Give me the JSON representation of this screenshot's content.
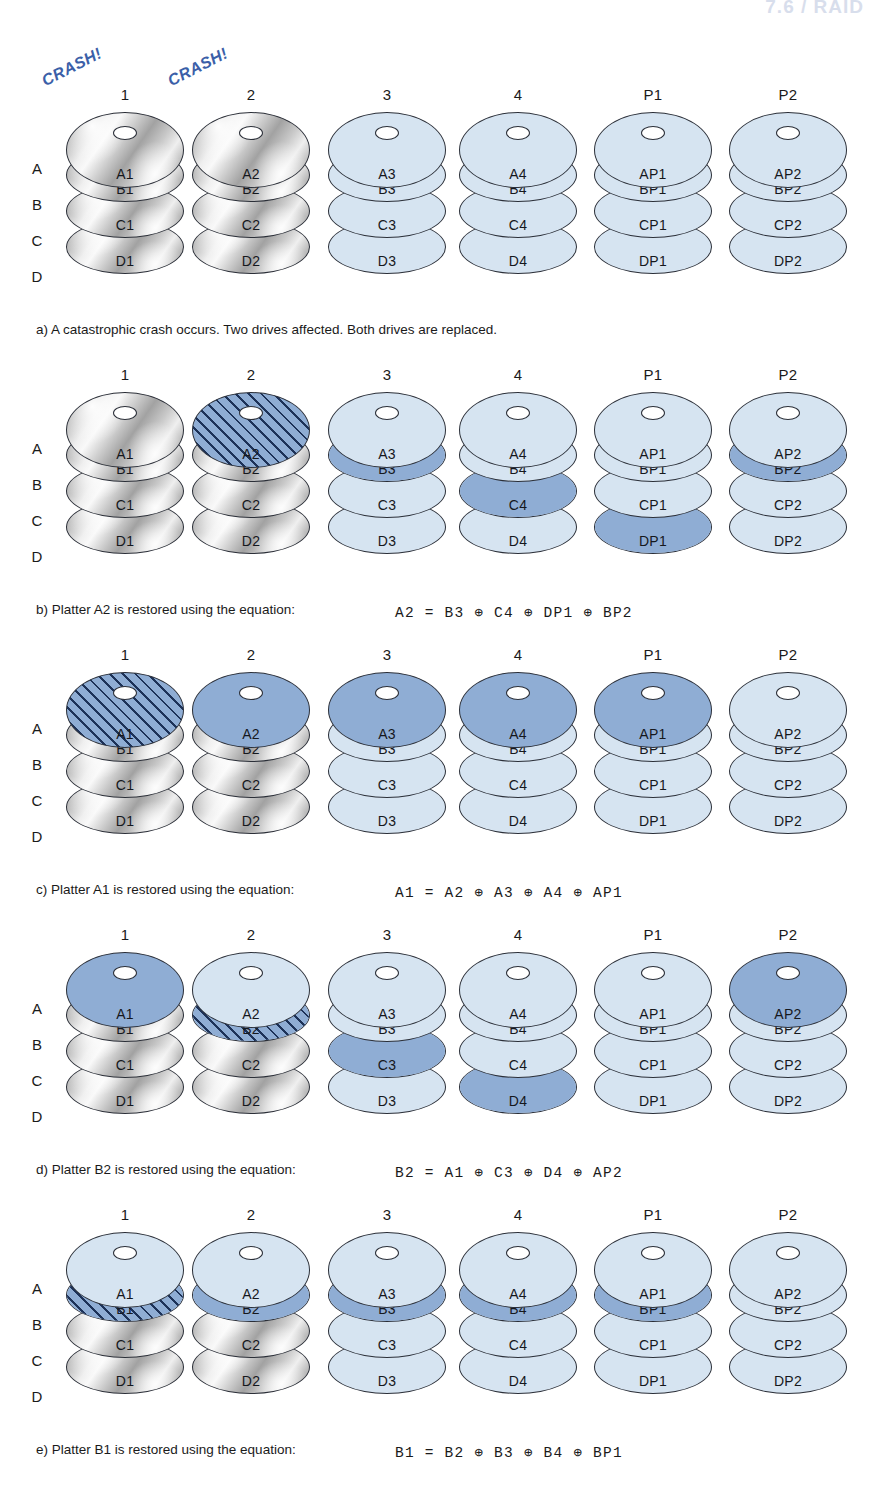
{
  "figure": {
    "page_header": "7.6 / RAID",
    "row_labels": [
      "A",
      "B",
      "C",
      "D"
    ],
    "columns": [
      "1",
      "2",
      "3",
      "4",
      "P1",
      "P2"
    ],
    "crash_label": "CRASH!",
    "xor_symbol": "⊕"
  },
  "panels": [
    {
      "id": "a",
      "caption": "a) A catastrophic crash occurs. Two drives affected. Both drives are replaced.",
      "equation": "",
      "crash_columns": [
        "1",
        "2"
      ],
      "stacks": [
        {
          "column": "1",
          "platters": [
            {
              "label": "A1",
              "state": "gray"
            },
            {
              "label": "B1",
              "state": "gray"
            },
            {
              "label": "C1",
              "state": "gray"
            },
            {
              "label": "D1",
              "state": "gray"
            }
          ]
        },
        {
          "column": "2",
          "platters": [
            {
              "label": "A2",
              "state": "gray"
            },
            {
              "label": "B2",
              "state": "gray"
            },
            {
              "label": "C2",
              "state": "gray"
            },
            {
              "label": "D2",
              "state": "gray"
            }
          ]
        },
        {
          "column": "3",
          "platters": [
            {
              "label": "A3",
              "state": "light"
            },
            {
              "label": "B3",
              "state": "light"
            },
            {
              "label": "C3",
              "state": "light"
            },
            {
              "label": "D3",
              "state": "light"
            }
          ]
        },
        {
          "column": "4",
          "platters": [
            {
              "label": "A4",
              "state": "light"
            },
            {
              "label": "B4",
              "state": "light"
            },
            {
              "label": "C4",
              "state": "light"
            },
            {
              "label": "D4",
              "state": "light"
            }
          ]
        },
        {
          "column": "P1",
          "platters": [
            {
              "label": "AP1",
              "state": "light"
            },
            {
              "label": "BP1",
              "state": "light"
            },
            {
              "label": "CP1",
              "state": "light"
            },
            {
              "label": "DP1",
              "state": "light"
            }
          ]
        },
        {
          "column": "P2",
          "platters": [
            {
              "label": "AP2",
              "state": "light"
            },
            {
              "label": "BP2",
              "state": "light"
            },
            {
              "label": "CP2",
              "state": "light"
            },
            {
              "label": "DP2",
              "state": "light"
            }
          ]
        }
      ]
    },
    {
      "id": "b",
      "caption": "b) Platter A2 is restored using the equation:",
      "equation": "A2  =  B3  ⊕  C4  ⊕  DP1  ⊕  BP2",
      "crash_columns": [],
      "stacks": [
        {
          "column": "1",
          "platters": [
            {
              "label": "A1",
              "state": "gray"
            },
            {
              "label": "B1",
              "state": "gray"
            },
            {
              "label": "C1",
              "state": "gray"
            },
            {
              "label": "D1",
              "state": "gray"
            }
          ]
        },
        {
          "column": "2",
          "platters": [
            {
              "label": "A2",
              "state": "hatch"
            },
            {
              "label": "B2",
              "state": "gray"
            },
            {
              "label": "C2",
              "state": "gray"
            },
            {
              "label": "D2",
              "state": "gray"
            }
          ]
        },
        {
          "column": "3",
          "platters": [
            {
              "label": "A3",
              "state": "light"
            },
            {
              "label": "B3",
              "state": "highlight"
            },
            {
              "label": "C3",
              "state": "light"
            },
            {
              "label": "D3",
              "state": "light"
            }
          ]
        },
        {
          "column": "4",
          "platters": [
            {
              "label": "A4",
              "state": "light"
            },
            {
              "label": "B4",
              "state": "light"
            },
            {
              "label": "C4",
              "state": "highlight"
            },
            {
              "label": "D4",
              "state": "light"
            }
          ]
        },
        {
          "column": "P1",
          "platters": [
            {
              "label": "AP1",
              "state": "light"
            },
            {
              "label": "BP1",
              "state": "light"
            },
            {
              "label": "CP1",
              "state": "light"
            },
            {
              "label": "DP1",
              "state": "highlight"
            }
          ]
        },
        {
          "column": "P2",
          "platters": [
            {
              "label": "AP2",
              "state": "light"
            },
            {
              "label": "BP2",
              "state": "highlight"
            },
            {
              "label": "CP2",
              "state": "light"
            },
            {
              "label": "DP2",
              "state": "light"
            }
          ]
        }
      ]
    },
    {
      "id": "c",
      "caption": "c) Platter A1 is restored using the equation:",
      "equation": "A1  =  A2  ⊕  A3  ⊕  A4  ⊕  AP1",
      "crash_columns": [],
      "stacks": [
        {
          "column": "1",
          "platters": [
            {
              "label": "A1",
              "state": "hatch"
            },
            {
              "label": "B1",
              "state": "gray"
            },
            {
              "label": "C1",
              "state": "gray"
            },
            {
              "label": "D1",
              "state": "gray"
            }
          ]
        },
        {
          "column": "2",
          "platters": [
            {
              "label": "A2",
              "state": "highlight"
            },
            {
              "label": "B2",
              "state": "gray"
            },
            {
              "label": "C2",
              "state": "gray"
            },
            {
              "label": "D2",
              "state": "gray"
            }
          ]
        },
        {
          "column": "3",
          "platters": [
            {
              "label": "A3",
              "state": "highlight"
            },
            {
              "label": "B3",
              "state": "light"
            },
            {
              "label": "C3",
              "state": "light"
            },
            {
              "label": "D3",
              "state": "light"
            }
          ]
        },
        {
          "column": "4",
          "platters": [
            {
              "label": "A4",
              "state": "highlight"
            },
            {
              "label": "B4",
              "state": "light"
            },
            {
              "label": "C4",
              "state": "light"
            },
            {
              "label": "D4",
              "state": "light"
            }
          ]
        },
        {
          "column": "P1",
          "platters": [
            {
              "label": "AP1",
              "state": "highlight"
            },
            {
              "label": "BP1",
              "state": "light"
            },
            {
              "label": "CP1",
              "state": "light"
            },
            {
              "label": "DP1",
              "state": "light"
            }
          ]
        },
        {
          "column": "P2",
          "platters": [
            {
              "label": "AP2",
              "state": "light"
            },
            {
              "label": "BP2",
              "state": "light"
            },
            {
              "label": "CP2",
              "state": "light"
            },
            {
              "label": "DP2",
              "state": "light"
            }
          ]
        }
      ]
    },
    {
      "id": "d",
      "caption": "d) Platter B2 is restored using the equation:",
      "equation": "B2  =  A1  ⊕  C3  ⊕  D4  ⊕  AP2",
      "crash_columns": [],
      "stacks": [
        {
          "column": "1",
          "platters": [
            {
              "label": "A1",
              "state": "highlight-top"
            },
            {
              "label": "B1",
              "state": "gray"
            },
            {
              "label": "C1",
              "state": "gray"
            },
            {
              "label": "D1",
              "state": "gray"
            }
          ]
        },
        {
          "column": "2",
          "platters": [
            {
              "label": "A2",
              "state": "light"
            },
            {
              "label": "B2",
              "state": "hatch"
            },
            {
              "label": "C2",
              "state": "gray"
            },
            {
              "label": "D2",
              "state": "gray"
            }
          ]
        },
        {
          "column": "3",
          "platters": [
            {
              "label": "A3",
              "state": "light"
            },
            {
              "label": "B3",
              "state": "light"
            },
            {
              "label": "C3",
              "state": "highlight"
            },
            {
              "label": "D3",
              "state": "light"
            }
          ]
        },
        {
          "column": "4",
          "platters": [
            {
              "label": "A4",
              "state": "light"
            },
            {
              "label": "B4",
              "state": "light"
            },
            {
              "label": "C4",
              "state": "light"
            },
            {
              "label": "D4",
              "state": "highlight"
            }
          ]
        },
        {
          "column": "P1",
          "platters": [
            {
              "label": "AP1",
              "state": "light"
            },
            {
              "label": "BP1",
              "state": "light"
            },
            {
              "label": "CP1",
              "state": "light"
            },
            {
              "label": "DP1",
              "state": "light"
            }
          ]
        },
        {
          "column": "P2",
          "platters": [
            {
              "label": "AP2",
              "state": "highlight-top"
            },
            {
              "label": "BP2",
              "state": "light"
            },
            {
              "label": "CP2",
              "state": "light"
            },
            {
              "label": "DP2",
              "state": "light"
            }
          ]
        }
      ]
    },
    {
      "id": "e",
      "caption": "e) Platter B1 is restored using the equation:",
      "equation": "B1  =  B2  ⊕  B3  ⊕  B4  ⊕  BP1",
      "crash_columns": [],
      "stacks": [
        {
          "column": "1",
          "platters": [
            {
              "label": "A1",
              "state": "light"
            },
            {
              "label": "B1",
              "state": "hatch"
            },
            {
              "label": "C1",
              "state": "gray"
            },
            {
              "label": "D1",
              "state": "gray"
            }
          ]
        },
        {
          "column": "2",
          "platters": [
            {
              "label": "A2",
              "state": "light"
            },
            {
              "label": "B2",
              "state": "highlight"
            },
            {
              "label": "C2",
              "state": "gray"
            },
            {
              "label": "D2",
              "state": "gray"
            }
          ]
        },
        {
          "column": "3",
          "platters": [
            {
              "label": "A3",
              "state": "light"
            },
            {
              "label": "B3",
              "state": "highlight"
            },
            {
              "label": "C3",
              "state": "light"
            },
            {
              "label": "D3",
              "state": "light"
            }
          ]
        },
        {
          "column": "4",
          "platters": [
            {
              "label": "A4",
              "state": "light"
            },
            {
              "label": "B4",
              "state": "highlight"
            },
            {
              "label": "C4",
              "state": "light"
            },
            {
              "label": "D4",
              "state": "light"
            }
          ]
        },
        {
          "column": "P1",
          "platters": [
            {
              "label": "AP1",
              "state": "light"
            },
            {
              "label": "BP1",
              "state": "highlight"
            },
            {
              "label": "CP1",
              "state": "light"
            },
            {
              "label": "DP1",
              "state": "light"
            }
          ]
        },
        {
          "column": "P2",
          "platters": [
            {
              "label": "AP2",
              "state": "light"
            },
            {
              "label": "BP2",
              "state": "light"
            },
            {
              "label": "CP2",
              "state": "light"
            },
            {
              "label": "DP2",
              "state": "light"
            }
          ]
        }
      ]
    }
  ],
  "layout": {
    "column_centers": [
      125,
      251,
      387,
      518,
      653,
      788
    ],
    "panel_tops": [
      86,
      366,
      646,
      926,
      1206
    ],
    "row_label_offsets": [
      74,
      110,
      146,
      182
    ],
    "caption_offsets": {
      "y": 236,
      "x": 36
    },
    "equation_offsets": {
      "y": 238,
      "x": 395
    }
  },
  "colors": {
    "light_blue": "#d6e4f1",
    "highlight_blue": "#8fadd4",
    "hatch_line": "#1d3258",
    "outline": "#2b2f38",
    "crash_text": "#3b5fa8"
  }
}
